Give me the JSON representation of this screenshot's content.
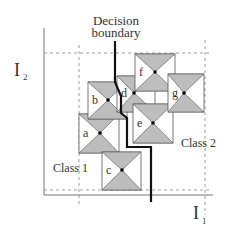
{
  "title": {
    "line1": "Decision",
    "line2": "boundary"
  },
  "axes": {
    "y_label": "I",
    "y_sub": "2",
    "x_label": "I",
    "x_sub": "1"
  },
  "classes": {
    "class1": "Class 1",
    "class2": "Class 2"
  },
  "points": [
    {
      "id": "a",
      "label": "a",
      "cx": 100,
      "cy": 133,
      "x0": 79,
      "y0": 114,
      "x1": 119,
      "y1": 153
    },
    {
      "id": "b",
      "label": "b",
      "cx": 108,
      "cy": 100,
      "x0": 88,
      "y0": 82,
      "x1": 127,
      "y1": 119
    },
    {
      "id": "c",
      "label": "c",
      "cx": 122,
      "cy": 170,
      "x0": 102,
      "y0": 152,
      "x1": 141,
      "y1": 190
    },
    {
      "id": "d",
      "label": "d",
      "cx": 134,
      "cy": 93,
      "x0": 117,
      "y0": 76,
      "x1": 155,
      "y1": 112
    },
    {
      "id": "e",
      "label": "e",
      "cx": 153,
      "cy": 123,
      "x0": 133,
      "y0": 104,
      "x1": 173,
      "y1": 143
    },
    {
      "id": "f",
      "label": "f",
      "cx": 155,
      "cy": 72,
      "x0": 135,
      "y0": 54,
      "x1": 175,
      "y1": 91
    },
    {
      "id": "g",
      "label": "g",
      "cx": 184,
      "cy": 93,
      "x0": 168,
      "y0": 74,
      "x1": 204,
      "y1": 112
    }
  ],
  "colors": {
    "fill": "#bdbdbd",
    "stroke": "#555555",
    "boundary": "#111111",
    "axis": "#777777",
    "dash": "#888888"
  }
}
